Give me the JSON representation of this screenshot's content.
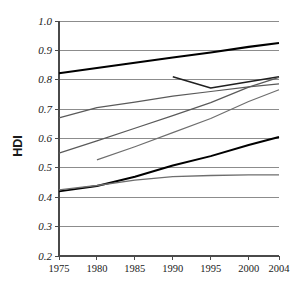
{
  "chart_data": {
    "type": "line",
    "title": "",
    "subtitle": "",
    "xlabel": "",
    "ylabel": "HDI",
    "xlim": [
      1975,
      2004
    ],
    "ylim": [
      0.2,
      1.0
    ],
    "grid": true,
    "legend_position": "none",
    "xticks": [
      1975,
      1980,
      1985,
      1990,
      1995,
      2000,
      2004
    ],
    "xtick_labels": [
      "1975",
      "1980",
      "1985",
      "1990",
      "1995",
      "2000",
      "2004"
    ],
    "yticks": [
      0.2,
      0.3,
      0.4,
      0.5,
      0.6,
      0.7,
      0.8,
      0.9,
      1.0
    ],
    "ytick_labels": [
      "0.2",
      "0.3",
      "0.4",
      "0.5",
      "0.6",
      "0.7",
      "0.8",
      "0.9",
      "1.0"
    ],
    "annotations": [],
    "series": [
      {
        "name": "series-1-top",
        "color": "#000000",
        "width": 2.1,
        "x": [
          1975,
          1980,
          1985,
          1990,
          1995,
          2000,
          2004
        ],
        "values": [
          0.822,
          0.84,
          0.858,
          0.876,
          0.893,
          0.912,
          0.925
        ]
      },
      {
        "name": "series-2",
        "color": "#5a5a5a",
        "width": 1.2,
        "x": [
          1975,
          1980,
          1985,
          1990,
          1995,
          2000,
          2004
        ],
        "values": [
          0.67,
          0.705,
          0.724,
          0.744,
          0.76,
          0.776,
          0.786
        ]
      },
      {
        "name": "series-3-dip",
        "color": "#202020",
        "width": 1.5,
        "x": [
          1990,
          1995,
          2000,
          2004
        ],
        "values": [
          0.81,
          0.772,
          0.793,
          0.81
        ]
      },
      {
        "name": "series-4",
        "color": "#5a5a5a",
        "width": 1.2,
        "x": [
          1975,
          1980,
          1985,
          1990,
          1995,
          2000,
          2004
        ],
        "values": [
          0.55,
          0.592,
          0.635,
          0.678,
          0.722,
          0.775,
          0.808
        ]
      },
      {
        "name": "series-5",
        "color": "#6e6e6e",
        "width": 1.2,
        "x": [
          1980,
          1985,
          1990,
          1995,
          2000,
          2004
        ],
        "values": [
          0.527,
          0.572,
          0.62,
          0.668,
          0.726,
          0.766
        ]
      },
      {
        "name": "series-6",
        "color": "#000000",
        "width": 2.0,
        "x": [
          1975,
          1980,
          1985,
          1990,
          1995,
          2000,
          2004
        ],
        "values": [
          0.42,
          0.438,
          0.47,
          0.508,
          0.54,
          0.578,
          0.605
        ]
      },
      {
        "name": "series-7",
        "color": "#6e6e6e",
        "width": 1.3,
        "x": [
          1975,
          1980,
          1985,
          1990,
          1995,
          2000,
          2004
        ],
        "values": [
          0.425,
          0.44,
          0.458,
          0.47,
          0.474,
          0.476,
          0.476
        ]
      }
    ]
  }
}
